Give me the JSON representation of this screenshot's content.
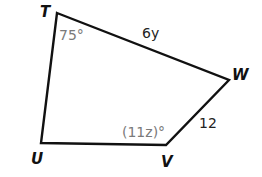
{
  "figure": {
    "shape": "quadrilateral",
    "stroke_color": "#111111",
    "angle_label_color": "#7a7a7a",
    "vertices": {
      "T": {
        "label": "T",
        "x": 57,
        "y": 13
      },
      "W": {
        "label": "W",
        "x": 229,
        "y": 80
      },
      "V": {
        "label": "V",
        "x": 166,
        "y": 145
      },
      "U": {
        "label": "U",
        "x": 41,
        "y": 143
      }
    },
    "sides": {
      "TW": {
        "label": "6y"
      },
      "WV": {
        "label": "12"
      }
    },
    "angles": {
      "T": {
        "label": "75°"
      },
      "V": {
        "label": "(11z)°"
      }
    }
  }
}
